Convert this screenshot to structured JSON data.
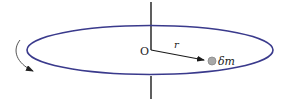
{
  "diagram": {
    "labels": {
      "origin": "O",
      "radius": "r",
      "mass_element": "δm"
    },
    "colors": {
      "ring": "#3a3a8c",
      "axis": "#1a1a1a",
      "radius_arrow": "#1a1a1a",
      "rotation_arrow": "#555555",
      "mass_dot_fill": "#a8a8a8",
      "mass_dot_stroke": "#888888",
      "text": "#222222"
    },
    "icons": {
      "rotation": "curved-arrow-clockwise",
      "mass": "filled-circle"
    }
  }
}
